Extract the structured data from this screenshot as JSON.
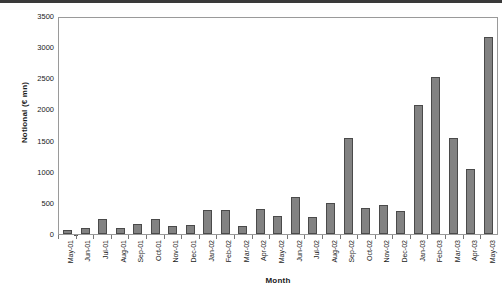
{
  "chart_data": {
    "type": "bar",
    "title": "",
    "xlabel": "Month",
    "ylabel": "Notional (€ mn)",
    "ylim": [
      0,
      3500
    ],
    "ytick_step": 500,
    "yticks": [
      3500,
      3000,
      2500,
      2000,
      1500,
      1000,
      500,
      0
    ],
    "ytick_labels": [
      "3500",
      "3000",
      "2500",
      "2000",
      "1500",
      "1000",
      "500",
      "0"
    ],
    "grid": false,
    "legend": null,
    "bar_color": "#828282",
    "bar_border_color": "#4a4a4a",
    "categories": [
      "May-01",
      "Jun-01",
      "Jul-01",
      "Aug-01",
      "Sep-01",
      "Oct-01",
      "Nov-01",
      "Dec-01",
      "Jan-02",
      "Feb-02",
      "Mar-02",
      "Apr-02",
      "May-02",
      "Jun-02",
      "Jul-02",
      "Aug-02",
      "Sep-02",
      "Oct-02",
      "Nov-02",
      "Dec-02",
      "Jan-03",
      "Feb-03",
      "Mar-03",
      "Apr-03",
      "May-03"
    ],
    "values": [
      65,
      95,
      235,
      95,
      160,
      235,
      130,
      150,
      390,
      390,
      125,
      400,
      290,
      595,
      280,
      495,
      1545,
      420,
      465,
      370,
      2070,
      2520,
      1540,
      1040,
      3170
    ]
  }
}
